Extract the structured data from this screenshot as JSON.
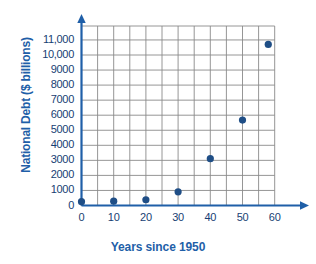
{
  "chart_data": {
    "type": "scatter",
    "title": "",
    "xlabel": "Years since 1950",
    "ylabel": "National Debt ($ billions)",
    "xlim": [
      0,
      60
    ],
    "ylim": [
      0,
      11500
    ],
    "grid": true,
    "legend": false,
    "x_ticks": [
      "0",
      "10",
      "20",
      "30",
      "40",
      "50",
      "60"
    ],
    "x_tick_values": [
      0,
      10,
      20,
      30,
      40,
      50,
      60
    ],
    "y_ticks": [
      "1000",
      "2000",
      "3000",
      "4000",
      "5000",
      "6000",
      "7000",
      "8000",
      "9000",
      "10,000",
      "11,000"
    ],
    "y_tick_values": [
      1000,
      2000,
      3000,
      4000,
      5000,
      6000,
      7000,
      8000,
      9000,
      10000,
      11000
    ],
    "origin_label": "0",
    "x_gridline_step": 5,
    "y_gridline_step": 1000,
    "series": [
      {
        "name": "National Debt",
        "marker": "circle",
        "color": "#1F4E86",
        "points": [
          {
            "x": 0,
            "y": 257
          },
          {
            "x": 10,
            "y": 286
          },
          {
            "x": 20,
            "y": 381
          },
          {
            "x": 30,
            "y": 909
          },
          {
            "x": 40,
            "y": 3113
          },
          {
            "x": 50,
            "y": 5674
          },
          {
            "x": 58,
            "y": 10700
          }
        ]
      }
    ],
    "colors": {
      "axis": "#1F5FA8",
      "grid": "#8A8A8A",
      "marker": "#1F4E86",
      "label": "#173E73",
      "title": "#1F5FA8",
      "background": "#FFFFFF"
    }
  }
}
